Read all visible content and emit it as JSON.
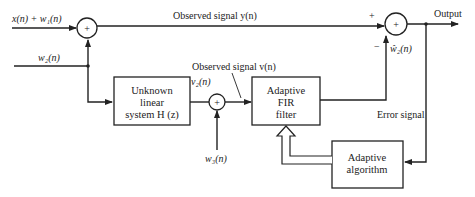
{
  "inputs": {
    "x_plus_w1": "x(n) + w₁(n)",
    "w2": "w₂(n)",
    "w3": "w₃(n)"
  },
  "signals": {
    "observed_y": "Observed signal y(n)",
    "observed_v": "Observed signal v(n)",
    "v2": "v₂(n)",
    "w2_hat": "ŵ₂(n)",
    "output": "Output",
    "error": "Error signal"
  },
  "blocks": {
    "unknown_system": [
      "Unknown",
      "linear",
      "system H (z)"
    ],
    "adaptive_fir": [
      "Adaptive",
      "FIR",
      "filter"
    ],
    "adaptive_algorithm": [
      "Adaptive",
      "algorithm"
    ]
  },
  "junctions": {
    "sum_symbol": "+",
    "plus_sign": "+",
    "minus_sign": "−"
  }
}
